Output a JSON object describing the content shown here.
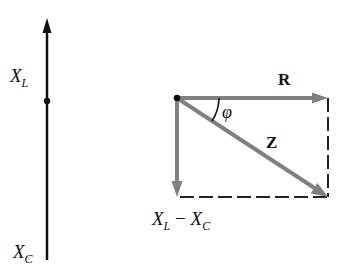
{
  "left_axis": {
    "top_label": {
      "main": "X",
      "sub": "L"
    },
    "bottom_label": {
      "main": "X",
      "sub": "C"
    }
  },
  "phasor_diagram": {
    "resistance_label": "R",
    "impedance_label": "Z",
    "angle_label": "φ",
    "reactance_label": {
      "a_main": "X",
      "a_sub": "L",
      "minus": " − ",
      "b_main": "X",
      "b_sub": "C"
    }
  },
  "colors": {
    "axis": "#111111",
    "vector": "#808080",
    "dashed": "#222222"
  }
}
